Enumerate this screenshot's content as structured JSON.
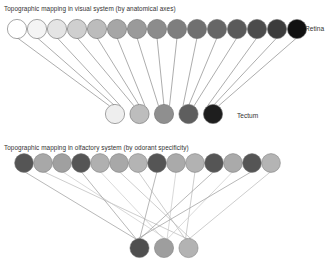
{
  "visual": {
    "title": "Topographic mapping in visual system (by anatomical axes)",
    "retina_label": "Retina",
    "tectum_label": "Tectum",
    "retina_cells": [
      "#ffffff",
      "#f4f4f4",
      "#e4e4e4",
      "#cfcfcf",
      "#bcbcbc",
      "#a6a6a6",
      "#9a9a9a",
      "#8c8c8c",
      "#7e7e7e",
      "#707070",
      "#666666",
      "#5a5a5a",
      "#4c4c4c",
      "#3c3c3c",
      "#111111"
    ],
    "tectum_cells": [
      "#eeeeee",
      "#bdbdbd",
      "#8f8f8f",
      "#5e5e5e",
      "#1e1e1e"
    ]
  },
  "olfactory": {
    "title": "Topographic mapping in olfactory system (by odorant specificity)",
    "receptor_cells": [
      "#555555",
      "#a8a8a8",
      "#a0a0a0",
      "#555555",
      "#b0b0b0",
      "#a8a8a8",
      "#b4b4b4",
      "#555555",
      "#aaaaaa",
      "#b2b2b2",
      "#555555",
      "#aaaaaa",
      "#555555",
      "#b4b4b4"
    ],
    "glomeruli": [
      "#4f4f4f",
      "#9e9e9e",
      "#b3b3b3"
    ],
    "connections": [
      [
        0,
        0
      ],
      [
        1,
        2
      ],
      [
        2,
        1
      ],
      [
        3,
        0
      ],
      [
        4,
        1
      ],
      [
        5,
        2
      ],
      [
        6,
        2
      ],
      [
        7,
        0
      ],
      [
        8,
        1
      ],
      [
        9,
        2
      ],
      [
        10,
        0
      ],
      [
        11,
        1
      ],
      [
        12,
        0
      ],
      [
        13,
        2
      ]
    ]
  }
}
